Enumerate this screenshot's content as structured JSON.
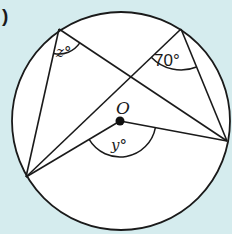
{
  "figure": {
    "part_marker": ")",
    "background_color": "#d5ecee",
    "circle_fill": "#ffffff",
    "stroke_color": "#1a1a1a",
    "circle": {
      "cx": 121,
      "cy": 121,
      "r": 109
    },
    "center": {
      "label": "O",
      "x": 120,
      "y": 121
    },
    "points": {
      "A": {
        "x": 59,
        "y": 29
      },
      "B": {
        "x": 181,
        "y": 29
      },
      "C": {
        "x": 26,
        "y": 177
      },
      "D": {
        "x": 227,
        "y": 141
      }
    },
    "angles": {
      "z": {
        "label": "z°",
        "vertex": "A"
      },
      "seventy": {
        "label": "70°",
        "vertex": "B"
      },
      "y": {
        "label": "y°",
        "vertex": "O"
      }
    }
  }
}
